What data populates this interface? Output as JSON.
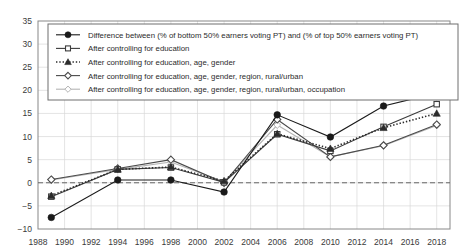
{
  "chart_data": {
    "type": "line",
    "title": "",
    "xlabel": "",
    "ylabel": "",
    "xlim": [
      1988,
      2019
    ],
    "ylim": [
      -10,
      35
    ],
    "grid": true,
    "legend_position": "top-inside",
    "x": [
      1989,
      1994,
      1998,
      2002,
      2006,
      2010,
      2014,
      2018
    ],
    "xticks": [
      1988,
      1990,
      1992,
      1994,
      1996,
      1998,
      2000,
      2002,
      2004,
      2006,
      2008,
      2010,
      2012,
      2014,
      2016,
      2018
    ],
    "yticks": [
      -10,
      -5,
      0,
      5,
      10,
      15,
      20,
      25,
      30,
      35
    ],
    "zero_reference_line": 0,
    "series": [
      {
        "name": "Difference between (% of bottom 50% earners voting PT) and (% of top 50% earners voting PT)",
        "marker": "filled-circle",
        "linestyle": "solid",
        "color": "#1a1a1a",
        "values": [
          -7.5,
          0.6,
          0.6,
          -2.0,
          14.7,
          9.9,
          16.6,
          19.4
        ]
      },
      {
        "name": "After controlling for education",
        "marker": "open-square",
        "linestyle": "solid",
        "color": "#3c3c3c",
        "values": [
          -3.0,
          2.9,
          3.3,
          0.1,
          10.5,
          6.9,
          12.1,
          17.0
        ]
      },
      {
        "name": "After controlling for education, age, gender",
        "marker": "filled-triangle",
        "linestyle": "dotted",
        "color": "#2b2b2b",
        "values": [
          -2.8,
          2.9,
          3.4,
          0.4,
          10.6,
          7.4,
          11.9,
          15.0
        ]
      },
      {
        "name": "After controlling for education, age, gender, region, rural/urban",
        "marker": "open-diamond",
        "linestyle": "solid",
        "color": "#4a4a4a",
        "values": [
          0.7,
          3.1,
          5.0,
          0.0,
          13.7,
          5.6,
          8.1,
          12.6
        ]
      },
      {
        "name": "After controlling for education, age, gender, region, rural/urban, occupation",
        "marker": "open-diamond-light",
        "linestyle": "solid",
        "color": "#b4b4b4",
        "values": [
          0.6,
          2.9,
          4.5,
          0.2,
          12.5,
          5.6,
          8.0,
          12.4
        ]
      }
    ]
  }
}
